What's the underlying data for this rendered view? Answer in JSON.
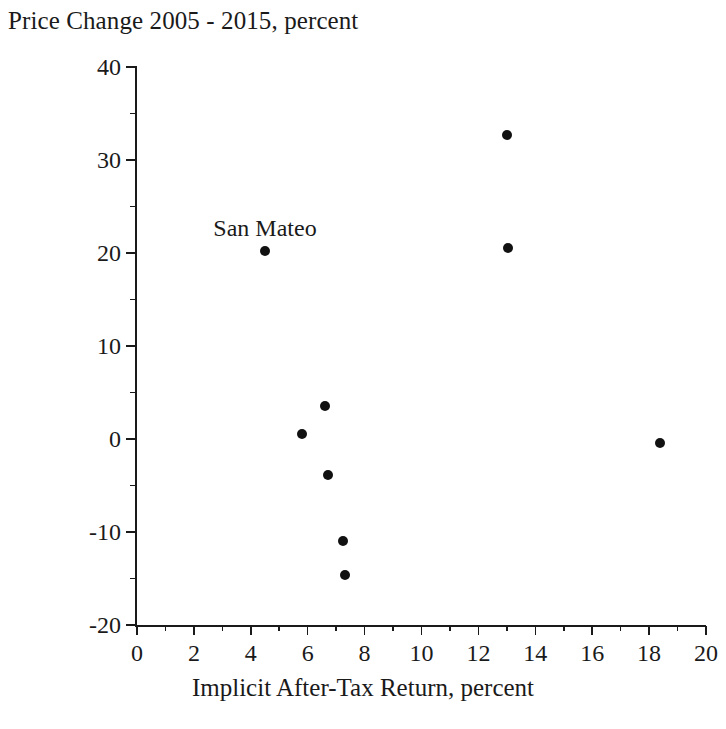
{
  "chart_data": {
    "type": "scatter",
    "title": "Price Change 2005 - 2015, percent",
    "xlabel": "Implicit After-Tax Return, percent",
    "ylabel": "",
    "xlim": [
      0,
      20
    ],
    "ylim": [
      -20,
      40
    ],
    "grid": false,
    "legend": null,
    "x_major_ticks": [
      0,
      2,
      4,
      6,
      8,
      10,
      12,
      14,
      16,
      18,
      20
    ],
    "x_minor_ticks": [
      1,
      3,
      5,
      7,
      9,
      11,
      13,
      15,
      17,
      19
    ],
    "y_major_ticks": [
      -20,
      -10,
      0,
      10,
      20,
      30,
      40
    ],
    "y_minor_ticks": [
      -15,
      -5,
      5,
      15,
      25,
      35
    ],
    "x_tick_labels": [
      "0",
      "2",
      "4",
      "6",
      "8",
      "10",
      "12",
      "14",
      "16",
      "18",
      "20"
    ],
    "y_tick_labels": [
      "-20",
      "-10",
      "0",
      "10",
      "20",
      "30",
      "40"
    ],
    "marker": "filled-circle",
    "marker_color": "#111111",
    "points": [
      {
        "x": 4.5,
        "y": 20.2,
        "label": "San Mateo"
      },
      {
        "x": 5.8,
        "y": 0.5,
        "label": ""
      },
      {
        "x": 6.6,
        "y": 3.6,
        "label": ""
      },
      {
        "x": 6.7,
        "y": -3.9,
        "label": ""
      },
      {
        "x": 7.25,
        "y": -11.0,
        "label": ""
      },
      {
        "x": 7.3,
        "y": -14.6,
        "label": ""
      },
      {
        "x": 13.0,
        "y": 32.7,
        "label": ""
      },
      {
        "x": 13.05,
        "y": 20.5,
        "label": ""
      },
      {
        "x": 18.4,
        "y": -0.4,
        "label": ""
      }
    ],
    "annotations": [
      {
        "text": "San Mateo",
        "x": 4.5,
        "y": 20.2
      }
    ]
  }
}
